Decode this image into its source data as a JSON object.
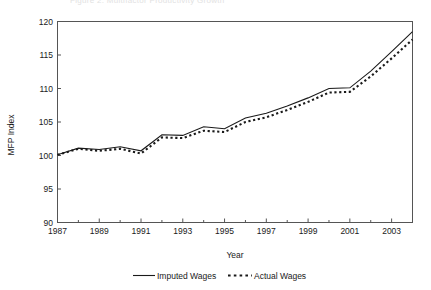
{
  "figure": {
    "ghost_title": "Figure 2. Multifactor Productivity Growth",
    "background": "#ffffff",
    "ink_color": "#1a1a1a"
  },
  "chart_data": {
    "type": "line",
    "title": "",
    "xlabel": "Year",
    "ylabel": "MFP Index",
    "xlim": [
      1987,
      2004
    ],
    "ylim": [
      90,
      120
    ],
    "ytick_labels": [
      "90",
      "95",
      "100",
      "105",
      "110",
      "115",
      "120"
    ],
    "yticks": [
      90,
      95,
      100,
      105,
      110,
      115,
      120
    ],
    "xtick_labels": [
      "1987",
      "1989",
      "1991",
      "1993",
      "1995",
      "1997",
      "1999",
      "2001",
      "2003"
    ],
    "xticks": [
      1987,
      1989,
      1991,
      1993,
      1995,
      1997,
      1999,
      2001,
      2003
    ],
    "minor_xticks": [
      1988,
      1990,
      1992,
      1994,
      1996,
      1998,
      2000,
      2002,
      2004
    ],
    "grid": false,
    "legend_position": "below",
    "x": [
      1987,
      1988,
      1989,
      1990,
      1991,
      1992,
      1993,
      1994,
      1995,
      1996,
      1997,
      1998,
      1999,
      2000,
      2001,
      2002,
      2003,
      2004
    ],
    "series": [
      {
        "name": "Imputed Wages",
        "style": "solid",
        "color": "#1a1a1a",
        "values": [
          100.1,
          101.1,
          100.9,
          101.3,
          100.7,
          103.1,
          103.0,
          104.3,
          104.0,
          105.6,
          106.3,
          107.4,
          108.6,
          110.0,
          110.1,
          112.6,
          115.5,
          118.5
        ]
      },
      {
        "name": "Actual Wages",
        "style": "dotted",
        "color": "#1a1a1a",
        "values": [
          100.1,
          101.0,
          100.7,
          101.0,
          100.3,
          102.7,
          102.6,
          103.7,
          103.5,
          105.0,
          105.7,
          106.8,
          108.0,
          109.4,
          109.5,
          111.8,
          114.5,
          117.3
        ]
      }
    ]
  },
  "legend": {
    "entries": [
      {
        "label": "Imputed Wages",
        "marker": "solid-line"
      },
      {
        "label": "Actual Wages",
        "marker": "dotted-line"
      }
    ]
  }
}
